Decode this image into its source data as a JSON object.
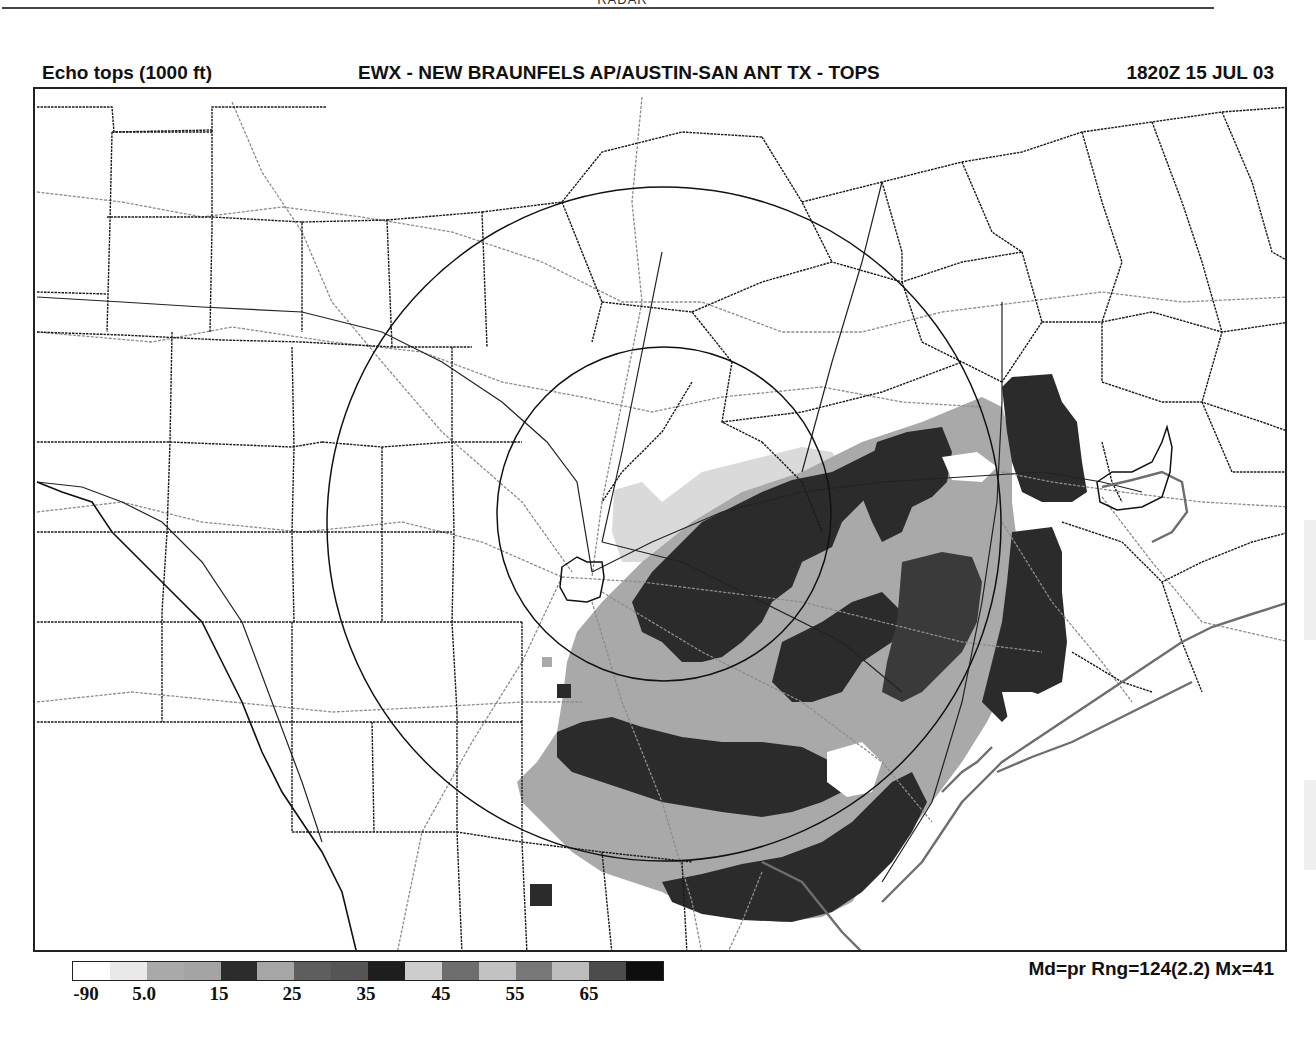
{
  "page": {
    "top_caption": "RADAR"
  },
  "header": {
    "product": "Echo tops (1000 ft)",
    "station": "EWX - NEW BRAUNFELS AP/AUSTIN-SAN ANT TX - TOPS",
    "datetime": "1820Z 15 JUL 03"
  },
  "map": {
    "radar_center": {
      "x": 662,
      "y": 520
    },
    "range_rings": [
      {
        "name": "outer",
        "cx": 662,
        "cy": 522,
        "r": 337
      },
      {
        "name": "inner",
        "cx": 662,
        "cy": 512,
        "r": 167
      }
    ],
    "colors": {
      "county_border": "#1a1a1a",
      "road": "#8a8a8a",
      "ring": "#111111",
      "echo_light": "#a9a9a9",
      "echo_dark": "#2b2b2b",
      "echo_faint": "#d8d8d8",
      "coast": "#777777"
    }
  },
  "legend": {
    "segments": [
      "#ffffff",
      "#e9e9e9",
      "#a9a9a9",
      "#a4a4a4",
      "#2c2c2c",
      "#a6a6a6",
      "#5e5e5e",
      "#555555",
      "#1e1e1e",
      "#cdcdcd",
      "#6e6e6e",
      "#c2c2c2",
      "#787878",
      "#bcbcbc",
      "#4c4c4c",
      "#0e0e0e"
    ],
    "labels": [
      {
        "text": "-90",
        "x": 86
      },
      {
        "text": "5.0",
        "x": 144
      },
      {
        "text": "15",
        "x": 219
      },
      {
        "text": "25",
        "x": 292
      },
      {
        "text": "35",
        "x": 366
      },
      {
        "text": "45",
        "x": 441
      },
      {
        "text": "55",
        "x": 515
      },
      {
        "text": "65",
        "x": 589
      }
    ]
  },
  "stats": {
    "text": "Md=pr Rng=124(2.2) Mx=41"
  }
}
